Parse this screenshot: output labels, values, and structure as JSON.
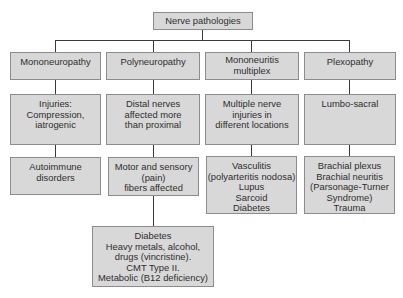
{
  "root": {
    "label": "Nerve pathologies"
  },
  "columns": [
    {
      "title": [
        "Mononeuropathy"
      ],
      "level2": [
        "Injuries:",
        "Compression,",
        "iatrogenic"
      ],
      "level3": [
        "Autoimmune",
        "disorders"
      ]
    },
    {
      "title": [
        "Polyneuropathy"
      ],
      "level2": [
        "Distal nerves",
        "affected more",
        "than proximal"
      ],
      "level3": [
        "Motor and sensory",
        "(pain)",
        "fibers affected"
      ],
      "level4": [
        "Diabetes",
        "Heavy metals, alcohol,",
        "drugs (vincristine).",
        "CMT Type II.",
        "Metabolic (B12 deficiency)"
      ]
    },
    {
      "title": [
        "Mononeuritis",
        "multiplex"
      ],
      "level2": [
        "Multiple nerve",
        "injuries in",
        "different locations"
      ],
      "level3": [
        "Vasculitis",
        "(polyarteritis nodosa)",
        "Lupus",
        "Sarcoid",
        "Diabetes"
      ]
    },
    {
      "title": [
        "Plexopathy"
      ],
      "level2": [
        "Lumbo-sacral"
      ],
      "level3": [
        "Brachial plexus",
        "Brachial neuritis",
        "(Parsonage-Turner",
        "Syndrome)",
        "Trauma"
      ]
    }
  ],
  "colors": {
    "box_fill": "#d8d8d8",
    "box_border": "#8c8c8c",
    "line": "#3a3a3a",
    "text": "#2e2e2e"
  }
}
